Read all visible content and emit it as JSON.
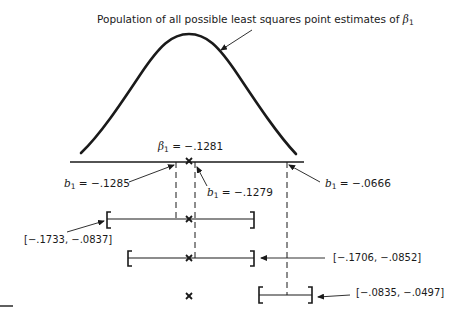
{
  "title": "Population of all possible least squares point estimates of",
  "title_symbol": "β",
  "title_symbol_sub": "1",
  "beta": {
    "symbol": "β",
    "sub": "1",
    "eq": " = −.1281"
  },
  "estimates": [
    {
      "symbol": "b",
      "sub": "1",
      "eq": " = −.1285"
    },
    {
      "symbol": "b",
      "sub": "1",
      "eq": " = −.1279"
    },
    {
      "symbol": "b",
      "sub": "1",
      "eq": " = −.0666"
    }
  ],
  "intervals": [
    {
      "label": "[−.1733, −.0837]"
    },
    {
      "label": "[−.1706, −.0852]"
    },
    {
      "label": "[−.0835, −.0497]"
    }
  ],
  "markers": {
    "true_value_symbol": "×"
  },
  "colors": {
    "ink": "#1a1a1a",
    "background": "#ffffff"
  }
}
